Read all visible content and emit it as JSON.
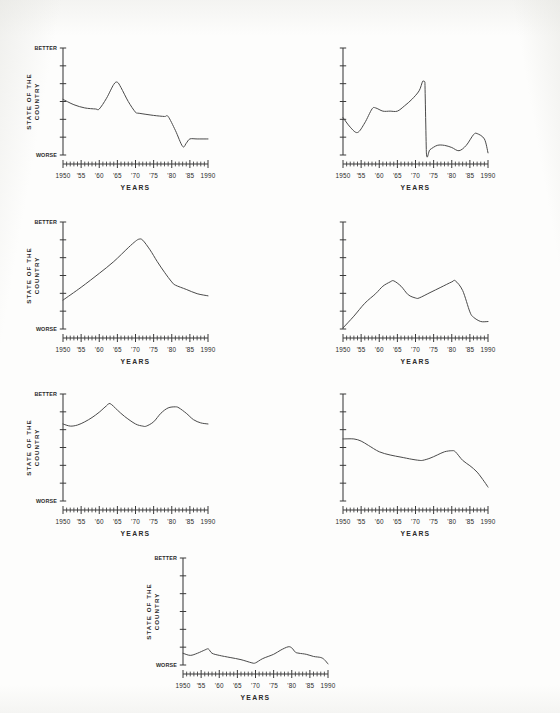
{
  "page": {
    "background_color": "#fdfdfc",
    "ink_color": "#3a3a3a",
    "figure_kind": "multi-panel line chart sheet"
  },
  "labels": {
    "better": "BETTER",
    "worse": "WORSE",
    "y_axis_title_line1": "STATE OF THE",
    "y_axis_title_line2": "COUNTRY",
    "x_axis_title": "YEARS"
  },
  "axis": {
    "x_tick_labels": [
      "1950",
      "'55",
      "'60",
      "'65",
      "'70",
      "'75",
      "'80",
      "'85",
      "1990"
    ],
    "x_tick_values": [
      1950,
      1955,
      1960,
      1965,
      1970,
      1975,
      1980,
      1985,
      1990
    ],
    "x_minor_interval_years": 1,
    "y_tick_count": 7,
    "xlim": [
      1950,
      1990
    ],
    "ylim": [
      0,
      1
    ]
  },
  "chart_data": [
    {
      "id": "panel-1",
      "type": "line",
      "position": "row1-left",
      "title": "",
      "xlabel": "YEARS",
      "ylabel": "STATE OF THE COUNTRY",
      "y_endpoint_labels": [
        "WORSE",
        "BETTER"
      ],
      "show_y_text_labels": true,
      "xlim": [
        1950,
        1990
      ],
      "ylim": [
        0,
        1
      ],
      "grid": false,
      "legend": "none",
      "x": [
        1950,
        1953,
        1956,
        1959,
        1960,
        1962,
        1964,
        1965,
        1966,
        1968,
        1970,
        1971,
        1975,
        1978,
        1979,
        1981,
        1983,
        1984,
        1985,
        1987,
        1990
      ],
      "values": [
        0.52,
        0.47,
        0.44,
        0.43,
        0.43,
        0.53,
        0.66,
        0.68,
        0.63,
        0.5,
        0.4,
        0.39,
        0.37,
        0.36,
        0.36,
        0.23,
        0.08,
        0.11,
        0.15,
        0.15,
        0.15
      ]
    },
    {
      "id": "panel-2",
      "type": "line",
      "position": "row1-right",
      "title": "",
      "xlabel": "YEARS",
      "ylabel": "",
      "y_endpoint_labels": [],
      "show_y_text_labels": false,
      "xlim": [
        1950,
        1990
      ],
      "ylim": [
        0,
        1
      ],
      "grid": false,
      "legend": "none",
      "x": [
        1950,
        1952,
        1954,
        1956,
        1958,
        1959,
        1961,
        1963,
        1965,
        1967,
        1969,
        1971,
        1972,
        1972.6,
        1973,
        1974,
        1976,
        1978,
        1980,
        1982,
        1984,
        1986,
        1987,
        1989,
        1990
      ],
      "values": [
        0.35,
        0.26,
        0.21,
        0.3,
        0.43,
        0.44,
        0.41,
        0.41,
        0.41,
        0.46,
        0.52,
        0.6,
        0.69,
        0.68,
        0.02,
        0.05,
        0.09,
        0.09,
        0.07,
        0.04,
        0.09,
        0.19,
        0.2,
        0.15,
        0.02
      ]
    },
    {
      "id": "panel-3",
      "type": "line",
      "position": "row2-left",
      "title": "",
      "xlabel": "YEARS",
      "ylabel": "STATE OF THE COUNTRY",
      "y_endpoint_labels": [
        "WORSE",
        "BETTER"
      ],
      "show_y_text_labels": true,
      "xlim": [
        1950,
        1990
      ],
      "ylim": [
        0,
        1
      ],
      "grid": false,
      "legend": "none",
      "x": [
        1950,
        1955,
        1960,
        1964,
        1968,
        1970,
        1971,
        1972,
        1974,
        1976,
        1978,
        1980,
        1981,
        1984,
        1987,
        1990
      ],
      "values": [
        0.27,
        0.39,
        0.52,
        0.63,
        0.76,
        0.82,
        0.84,
        0.83,
        0.74,
        0.63,
        0.53,
        0.44,
        0.41,
        0.37,
        0.33,
        0.31
      ]
    },
    {
      "id": "panel-4",
      "type": "line",
      "position": "row2-right",
      "title": "",
      "xlabel": "YEARS",
      "ylabel": "",
      "y_endpoint_labels": [],
      "show_y_text_labels": false,
      "xlim": [
        1950,
        1990
      ],
      "ylim": [
        0,
        1
      ],
      "grid": false,
      "legend": "none",
      "x": [
        1950,
        1953,
        1956,
        1959,
        1961,
        1963,
        1964,
        1966,
        1968,
        1970,
        1971,
        1974,
        1977,
        1980,
        1981,
        1983,
        1985,
        1986,
        1988,
        1990
      ],
      "values": [
        0.01,
        0.12,
        0.24,
        0.33,
        0.4,
        0.44,
        0.45,
        0.4,
        0.32,
        0.29,
        0.29,
        0.34,
        0.39,
        0.44,
        0.45,
        0.36,
        0.16,
        0.11,
        0.07,
        0.07
      ]
    },
    {
      "id": "panel-5",
      "type": "line",
      "position": "row3-left",
      "title": "",
      "xlabel": "YEARS",
      "ylabel": "STATE OF THE COUNTRY",
      "y_endpoint_labels": [
        "WORSE",
        "BETTER"
      ],
      "show_y_text_labels": true,
      "xlim": [
        1950,
        1990
      ],
      "ylim": [
        0,
        1
      ],
      "grid": false,
      "legend": "none",
      "x": [
        1950,
        1952,
        1954,
        1956,
        1958,
        1960,
        1962,
        1963,
        1965,
        1967,
        1970,
        1972,
        1973,
        1975,
        1977,
        1979,
        1981,
        1982,
        1984,
        1986,
        1988,
        1990
      ],
      "values": [
        0.72,
        0.7,
        0.71,
        0.74,
        0.78,
        0.83,
        0.89,
        0.91,
        0.85,
        0.79,
        0.72,
        0.7,
        0.7,
        0.74,
        0.82,
        0.87,
        0.88,
        0.87,
        0.82,
        0.76,
        0.73,
        0.72
      ]
    },
    {
      "id": "panel-6",
      "type": "line",
      "position": "row3-right",
      "title": "",
      "xlabel": "YEARS",
      "ylabel": "",
      "y_endpoint_labels": [],
      "show_y_text_labels": false,
      "xlim": [
        1950,
        1990
      ],
      "ylim": [
        0,
        1
      ],
      "grid": false,
      "legend": "none",
      "x": [
        1950,
        1953,
        1955,
        1957,
        1960,
        1963,
        1966,
        1969,
        1971,
        1972,
        1974,
        1976,
        1978,
        1980,
        1981,
        1983,
        1985,
        1987,
        1989,
        1990
      ],
      "values": [
        0.58,
        0.58,
        0.56,
        0.52,
        0.46,
        0.43,
        0.41,
        0.39,
        0.38,
        0.38,
        0.4,
        0.43,
        0.46,
        0.47,
        0.46,
        0.38,
        0.33,
        0.27,
        0.18,
        0.13
      ]
    },
    {
      "id": "panel-7",
      "type": "line",
      "position": "row4-center",
      "title": "",
      "xlabel": "YEARS",
      "ylabel": "STATE OF THE COUNTRY",
      "y_endpoint_labels": [
        "WORSE",
        "BETTER"
      ],
      "show_y_text_labels": true,
      "xlim": [
        1950,
        1990
      ],
      "ylim": [
        0,
        1
      ],
      "grid": false,
      "legend": "none",
      "x": [
        1950,
        1952,
        1954,
        1956,
        1957,
        1958,
        1960,
        1963,
        1966,
        1969,
        1970,
        1972,
        1975,
        1977,
        1979,
        1980,
        1981,
        1982,
        1984,
        1986,
        1988,
        1989,
        1990
      ],
      "values": [
        0.11,
        0.09,
        0.11,
        0.14,
        0.15,
        0.11,
        0.09,
        0.07,
        0.05,
        0.02,
        0.02,
        0.06,
        0.1,
        0.14,
        0.17,
        0.16,
        0.12,
        0.11,
        0.1,
        0.08,
        0.07,
        0.05,
        0.01
      ]
    }
  ]
}
